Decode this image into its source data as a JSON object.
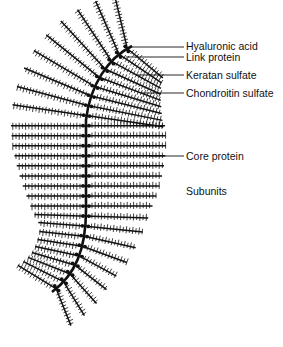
{
  "labels": {
    "hyaluronic_acid": "Hyaluronic acid",
    "link_protein": "Link protein",
    "keratan_sulfate": "Keratan sulfate",
    "chondroitin_sulfate": "Chondroitin sulfate",
    "core_protein": "Core protein",
    "subunits": "Subunits"
  },
  "colors": {
    "ink": "#111111",
    "background": "#ffffff"
  },
  "leaders": [
    {
      "name": "hyaluronic-acid",
      "x1": 132,
      "y1": 47,
      "x2": 184,
      "y2": 47
    },
    {
      "name": "link-protein",
      "x1": 126,
      "y1": 57,
      "x2": 184,
      "y2": 57
    },
    {
      "name": "keratan-sulfate",
      "x1": 136,
      "y1": 75,
      "x2": 184,
      "y2": 75
    },
    {
      "name": "chondroitin-sulfate",
      "x1": 142,
      "y1": 93,
      "x2": 184,
      "y2": 93
    },
    {
      "name": "core-protein",
      "x1": 150,
      "y1": 156,
      "x2": 184,
      "y2": 156
    }
  ]
}
